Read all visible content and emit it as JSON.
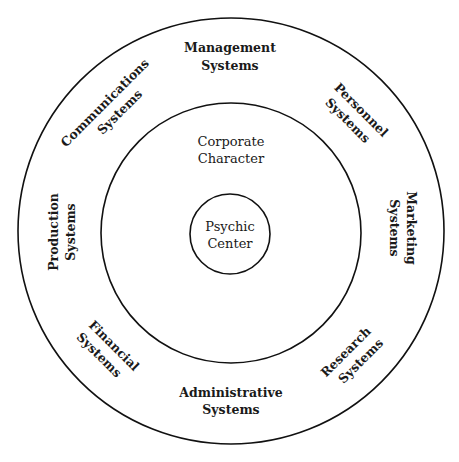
{
  "diagram": {
    "type": "concentric-circles",
    "colors": {
      "line": "#111111",
      "text": "#1a1a1a",
      "background": "#ffffff"
    },
    "center": {
      "line1": "Psychic",
      "line2": "Center"
    },
    "middle_ring": {
      "line1": "Corporate",
      "line2": "Character"
    },
    "outer_ring": [
      {
        "id": "management",
        "line1": "Management",
        "line2": "Systems"
      },
      {
        "id": "personnel",
        "line1": "Personnel",
        "line2": "Systems"
      },
      {
        "id": "marketing",
        "line1": "Marketing",
        "line2": "Systems"
      },
      {
        "id": "research",
        "line1": "Research",
        "line2": "Systems"
      },
      {
        "id": "administrative",
        "line1": "Administrative",
        "line2": "Systems"
      },
      {
        "id": "financial",
        "line1": "Financial",
        "line2": "Systems"
      },
      {
        "id": "production",
        "line1": "Production",
        "line2": "Systems"
      },
      {
        "id": "communications",
        "line1": "Communications",
        "line2": "Systems"
      }
    ]
  }
}
